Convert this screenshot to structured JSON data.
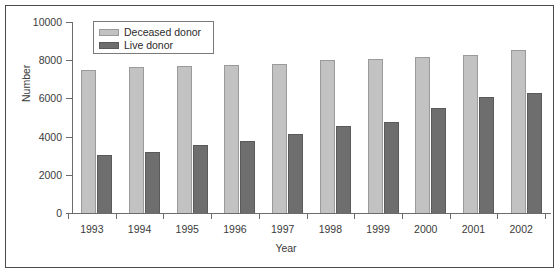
{
  "chart_data": {
    "type": "bar",
    "title": "",
    "xlabel": "Year",
    "ylabel": "Number",
    "categories": [
      "1993",
      "1994",
      "1995",
      "1996",
      "1997",
      "1998",
      "1999",
      "2000",
      "2001",
      "2002"
    ],
    "series": [
      {
        "name": "Deceased donor",
        "color": "#c2c2c2",
        "values": [
          7500,
          7650,
          7680,
          7760,
          7800,
          8000,
          8050,
          8150,
          8250,
          8530
        ]
      },
      {
        "name": "Live donor",
        "color": "#6e6e6e",
        "values": [
          3050,
          3200,
          3550,
          3750,
          4130,
          4550,
          4750,
          5500,
          6050,
          6300
        ]
      }
    ],
    "ylim": [
      0,
      10000
    ],
    "yticks": [
      0,
      2000,
      4000,
      6000,
      8000,
      10000
    ],
    "ytick_labels": [
      "0",
      "2000",
      "4000",
      "6000",
      "8000",
      "10000"
    ],
    "grid": false,
    "legend_position": "top-left"
  }
}
